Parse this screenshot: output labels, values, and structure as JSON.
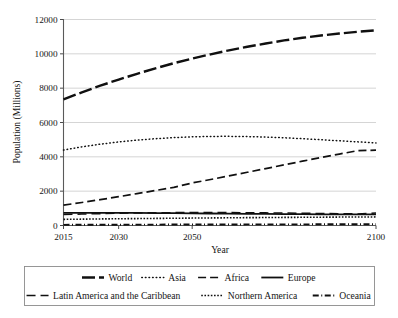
{
  "chart_data": {
    "type": "line",
    "title": "",
    "xlabel": "Year",
    "ylabel": "Population (Millions)",
    "xlim": [
      2015,
      2100
    ],
    "ylim": [
      0,
      12000
    ],
    "xticks": [
      2015,
      2030,
      2050,
      2100
    ],
    "yticks": [
      0,
      2000,
      4000,
      6000,
      8000,
      10000,
      12000
    ],
    "grid": true,
    "legend_position": "below",
    "x": [
      2015,
      2020,
      2025,
      2030,
      2035,
      2040,
      2045,
      2050,
      2055,
      2060,
      2065,
      2070,
      2075,
      2080,
      2085,
      2090,
      2095,
      2100
    ],
    "series": [
      {
        "name": "World",
        "style": "thick-dashed",
        "values": [
          7349,
          7758,
          8142,
          8501,
          8838,
          9157,
          9454,
          9725,
          9973,
          10202,
          10410,
          10603,
          10780,
          10934,
          11068,
          11184,
          11285,
          11370
        ]
      },
      {
        "name": "Asia",
        "style": "dotted",
        "values": [
          4393,
          4581,
          4737,
          4868,
          4974,
          5057,
          5120,
          5165,
          5190,
          5194,
          5180,
          5152,
          5110,
          5057,
          4997,
          4934,
          4873,
          4810
        ]
      },
      {
        "name": "Africa",
        "style": "dashed",
        "values": [
          1186,
          1340,
          1508,
          1679,
          1856,
          2037,
          2222,
          2478,
          2680,
          2888,
          3100,
          3315,
          3532,
          3747,
          3958,
          4162,
          4356,
          4387
        ]
      },
      {
        "name": "Europe",
        "style": "solid",
        "values": [
          738,
          740,
          739,
          736,
          731,
          724,
          716,
          707,
          698,
          689,
          681,
          673,
          665,
          658,
          652,
          647,
          643,
          646
        ]
      },
      {
        "name": "Latin America and the Caribbean",
        "style": "long-dash",
        "values": [
          634,
          664,
          691,
          712,
          729,
          741,
          750,
          754,
          754,
          751,
          745,
          736,
          726,
          714,
          702,
          689,
          677,
          721
        ]
      },
      {
        "name": "Northern America",
        "style": "fine-dotted",
        "values": [
          358,
          370,
          382,
          393,
          403,
          413,
          422,
          433,
          441,
          449,
          457,
          464,
          471,
          478,
          484,
          491,
          496,
          500
        ]
      },
      {
        "name": "Oceania",
        "style": "dash-dot",
        "values": [
          39,
          42,
          45,
          47,
          50,
          53,
          55,
          57,
          59,
          61,
          63,
          65,
          66,
          68,
          69,
          70,
          71,
          72
        ]
      }
    ]
  },
  "axes": {
    "ylabel": "Population (Millions)",
    "xlabel": "Year",
    "ytick_labels": [
      "0",
      "2000",
      "4000",
      "6000",
      "8000",
      "10000",
      "12000"
    ],
    "xtick_labels": [
      "2015",
      "2030",
      "2050",
      "2100"
    ]
  },
  "legend": {
    "row1": [
      {
        "label": "World",
        "style": "thick-dashed"
      },
      {
        "label": "Asia",
        "style": "dotted"
      },
      {
        "label": "Africa",
        "style": "dashed"
      },
      {
        "label": "Europe",
        "style": "solid"
      }
    ],
    "row2": [
      {
        "label": "Latin America and the Caribbean",
        "style": "long-dash"
      },
      {
        "label": "Northern America",
        "style": "fine-dotted"
      },
      {
        "label": "Oceania",
        "style": "dash-dot"
      }
    ]
  },
  "colors": {
    "line": "#101010",
    "grid": "#b9b9b9",
    "axis": "#5a5a5a",
    "background": "#ffffff"
  }
}
